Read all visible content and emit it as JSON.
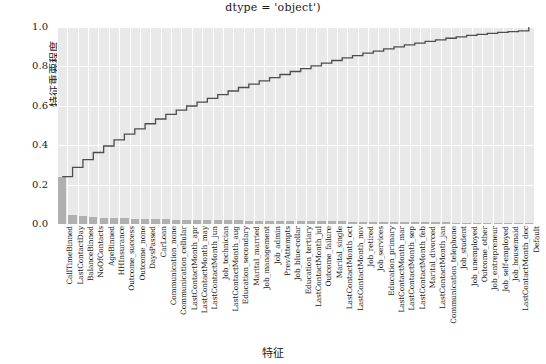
{
  "chart_data": {
    "type": "bar",
    "title": "dtype = 'object')",
    "xlabel": "特征",
    "ylabel": "特征重要程度",
    "ylim": [
      0.0,
      1.0
    ],
    "yticks": [
      "0.0",
      "0.2",
      "0.4",
      "0.6",
      "0.8",
      "1.0"
    ],
    "ytick_values": [
      0.0,
      0.2,
      0.4,
      0.6,
      0.8,
      1.0
    ],
    "grid": true,
    "legend": "none",
    "bar_color": "#b0b0b0",
    "line_color": "#4d4d4d",
    "categories": [
      "CallTimeBinned",
      "LastContactDay",
      "BalanceBinned",
      "NoOfContacts",
      "AgeBinned",
      "HHInsurance",
      "Outcome_success",
      "Outcome_none",
      "DaysPassed",
      "CarLoan",
      "Communication_none",
      "Communication_cellular",
      "LastContactMonth_apr",
      "LastContactMonth_may",
      "LastContactMonth_jun",
      "Job_technician",
      "LastContactMonth_aug",
      "Education_secondary",
      "Marital_married",
      "Job_management",
      "Job_admin",
      "PrevAttempts",
      "Job_blue-collar",
      "Education_tertiary",
      "LastContactMonth_jul",
      "Outcome_failure",
      "Marital_single",
      "LastContactMonth_oct",
      "LastContactMonth_nov",
      "Job_retired",
      "Job_services",
      "Education_primary",
      "LastContactMonth_mar",
      "LastContactMonth_sep",
      "LastContactMonth_feb",
      "Marital_divorced",
      "LastContactMonth_jan",
      "Communication_telephone",
      "Job_student",
      "Job_unemployed",
      "Outcome_other",
      "Job_entrepreneur",
      "Job_self-employed",
      "Job_housemaid",
      "LastContactMonth_dec",
      "Default"
    ],
    "values": [
      0.24,
      0.047,
      0.04,
      0.036,
      0.033,
      0.031,
      0.029,
      0.027,
      0.026,
      0.024,
      0.023,
      0.022,
      0.021,
      0.02,
      0.019,
      0.019,
      0.018,
      0.018,
      0.017,
      0.017,
      0.016,
      0.016,
      0.015,
      0.015,
      0.014,
      0.014,
      0.013,
      0.013,
      0.012,
      0.012,
      0.011,
      0.011,
      0.01,
      0.01,
      0.009,
      0.009,
      0.008,
      0.008,
      0.007,
      0.007,
      0.006,
      0.005,
      0.005,
      0.004,
      0.003,
      0.002
    ],
    "cumulative": [
      0.24,
      0.287,
      0.327,
      0.363,
      0.396,
      0.427,
      0.456,
      0.483,
      0.509,
      0.533,
      0.556,
      0.578,
      0.599,
      0.619,
      0.638,
      0.657,
      0.675,
      0.693,
      0.71,
      0.727,
      0.743,
      0.759,
      0.774,
      0.789,
      0.803,
      0.817,
      0.83,
      0.843,
      0.855,
      0.867,
      0.878,
      0.889,
      0.899,
      0.909,
      0.918,
      0.927,
      0.935,
      0.943,
      0.95,
      0.957,
      0.963,
      0.968,
      0.973,
      0.977,
      0.98,
      1.0
    ]
  }
}
